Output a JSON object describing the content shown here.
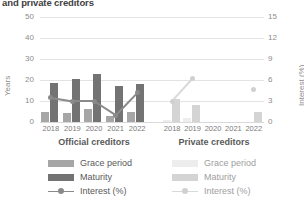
{
  "title": "and private creditors",
  "axes": {
    "left_label": "Years",
    "right_label": "Interest (%)",
    "left_ticks": [
      "50",
      "40",
      "30",
      "20",
      "10",
      "0"
    ],
    "right_ticks": [
      "15",
      "12",
      "9",
      "6",
      "3",
      "0"
    ]
  },
  "groups": {
    "official": {
      "label": "Official creditors",
      "legend": {
        "grace": "Grace period",
        "maturity": "Maturity",
        "interest": "Interest (%)"
      }
    },
    "private": {
      "label": "Private creditors",
      "legend": {
        "grace": "Grace period",
        "maturity": "Maturity",
        "interest": "Interest (%)"
      }
    }
  },
  "colors": {
    "official_grace": "#a6a6a6",
    "official_maturity": "#737373",
    "official_interest": "#8a8a8a",
    "private_grace": "#ededed",
    "private_maturity": "#d4d4d4",
    "private_interest": "#d9d9d9",
    "gridline": "#e3e3e3",
    "text": "#595959"
  },
  "chart_data": {
    "type": "bar",
    "title": "and private creditors",
    "xlabel": "",
    "ylabel": "Years",
    "y2label": "Interest (%)",
    "ylim": [
      0,
      50
    ],
    "y2lim": [
      0,
      15
    ],
    "yticks": [
      0,
      10,
      20,
      30,
      40,
      50
    ],
    "y2ticks": [
      0,
      3,
      6,
      9,
      12,
      15
    ],
    "grid": true,
    "legend_position": "bottom",
    "categories": [
      "2018",
      "2019",
      "2020",
      "2021",
      "2022"
    ],
    "panels": [
      {
        "name": "Official creditors",
        "series": [
          {
            "name": "Grace period",
            "axis": "left",
            "type": "bar",
            "values": [
              5,
              4.5,
              6,
              3,
              5
            ]
          },
          {
            "name": "Maturity",
            "axis": "left",
            "type": "bar",
            "values": [
              18.5,
              20.5,
              23,
              17,
              18
            ]
          },
          {
            "name": "Interest (%)",
            "axis": "right",
            "type": "line",
            "values": [
              3.5,
              3.0,
              3.0,
              1.0,
              4.2
            ]
          }
        ]
      },
      {
        "name": "Private creditors",
        "series": [
          {
            "name": "Grace period",
            "axis": "left",
            "type": "bar",
            "values": [
              1,
              2,
              0,
              0,
              0
            ]
          },
          {
            "name": "Maturity",
            "axis": "left",
            "type": "bar",
            "values": [
              11,
              8,
              0,
              0,
              5
            ]
          },
          {
            "name": "Interest (%)",
            "axis": "right",
            "type": "line",
            "values": [
              3.0,
              6.2,
              null,
              null,
              4.7
            ]
          }
        ]
      }
    ]
  }
}
